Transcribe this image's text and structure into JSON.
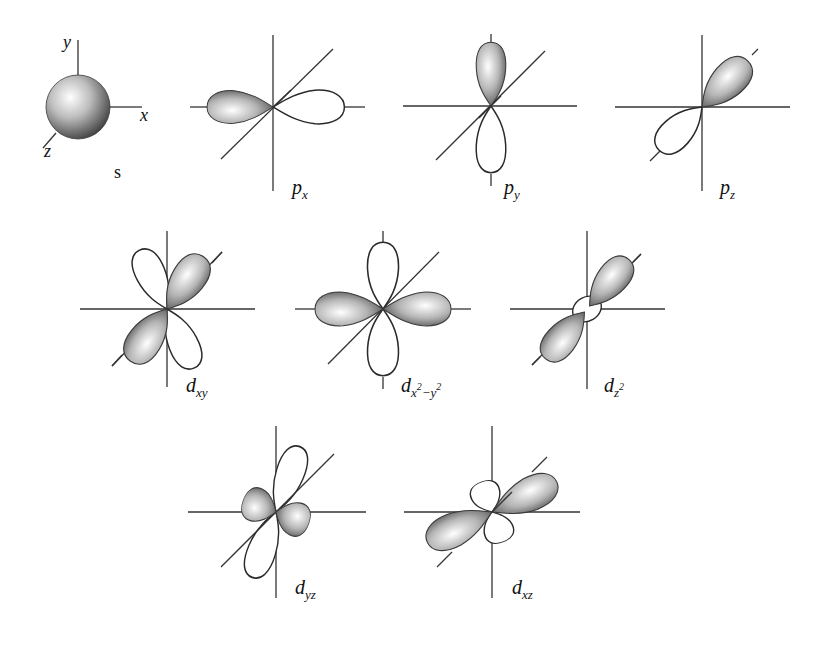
{
  "figure": {
    "colors": {
      "background": "#ffffff",
      "line": "#333333",
      "shade_dark": "#4a4a4a",
      "shade_light": "#f2f2f2"
    }
  },
  "axes_labels": {
    "x": "x",
    "y": "y",
    "z": "z"
  },
  "orbitals": [
    {
      "id": "s",
      "label_main": "s",
      "label_sub": "",
      "row": 1
    },
    {
      "id": "px",
      "label_main": "p",
      "label_sub": "x",
      "row": 1
    },
    {
      "id": "py",
      "label_main": "p",
      "label_sub": "y",
      "row": 1
    },
    {
      "id": "pz",
      "label_main": "p",
      "label_sub": "z",
      "row": 1
    },
    {
      "id": "dxy",
      "label_main": "d",
      "label_sub": "xy",
      "row": 2
    },
    {
      "id": "dx2y2",
      "label_main": "d",
      "label_sub": "x",
      "label_sup1": "2",
      "label_mid": "−y",
      "label_sup2": "2",
      "row": 2
    },
    {
      "id": "dz2",
      "label_main": "d",
      "label_sub": "z",
      "label_sup1": "2",
      "row": 2
    },
    {
      "id": "dyz",
      "label_main": "d",
      "label_sub": "yz",
      "row": 3
    },
    {
      "id": "dxz",
      "label_main": "d",
      "label_sub": "xz",
      "row": 3
    }
  ]
}
